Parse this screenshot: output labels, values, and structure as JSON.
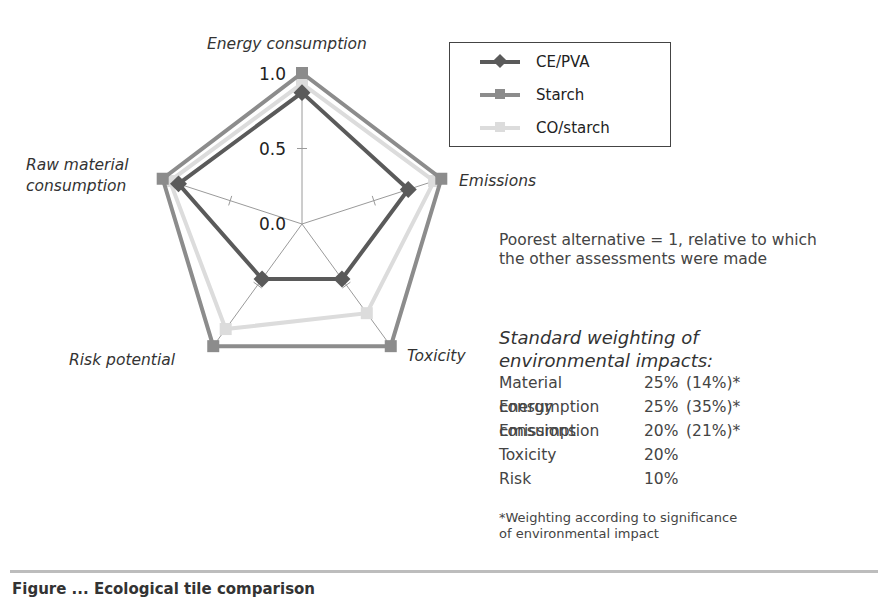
{
  "chart_data": {
    "type": "radar",
    "title": "",
    "axes": [
      "Energy consumption",
      "Emissions",
      "Toxicity",
      "Risk potential",
      "Raw material consumption"
    ],
    "axis_labels_display": {
      "energy": "Energy consumption",
      "emissions": "Emissions",
      "toxicity": "Toxicity",
      "risk": "Risk potential",
      "raw_line1": "Raw material",
      "raw_line2": "consumption"
    },
    "radial_ticks": [
      "0.0",
      "0.5",
      "1.0"
    ],
    "rlim": [
      0,
      1
    ],
    "series": [
      {
        "name": "CE/PVA",
        "marker": "diamond",
        "color": "#5a5a5a",
        "values": [
          0.87,
          0.74,
          0.45,
          0.45,
          0.86
        ]
      },
      {
        "name": "Starch",
        "marker": "square",
        "color": "#8c8c8c",
        "values": [
          1.0,
          0.97,
          1.0,
          1.0,
          0.97
        ]
      },
      {
        "name": "CO/starch",
        "marker": "square",
        "color": "#dcdcdc",
        "values": [
          0.93,
          0.92,
          0.73,
          0.86,
          0.92
        ]
      }
    ],
    "legend_position": "top-right"
  },
  "legend": {
    "items": [
      {
        "label": "CE/PVA"
      },
      {
        "label": "Starch"
      },
      {
        "label": "CO/starch"
      }
    ]
  },
  "note": "Poorest  alternative = 1, relative to which the other assessments were made",
  "weighting": {
    "title_line1": "Standard weighting of",
    "title_line2": "environmental impacts:",
    "rows": [
      {
        "name": "Material consumption",
        "value": "25%",
        "alt": "(14%)*"
      },
      {
        "name": "Energy consumption",
        "value": "25%",
        "alt": "(35%)*"
      },
      {
        "name": "Emissions",
        "value": "20%",
        "alt": "(21%)*"
      },
      {
        "name": "Toxicity",
        "value": "20%",
        "alt": ""
      },
      {
        "name": "Risk",
        "value": "10%",
        "alt": ""
      }
    ],
    "footnote_line1": "*Weighting according to significance",
    "footnote_line2": "of environmental impact"
  },
  "caption": "Figure ...   Ecological tile comparison"
}
